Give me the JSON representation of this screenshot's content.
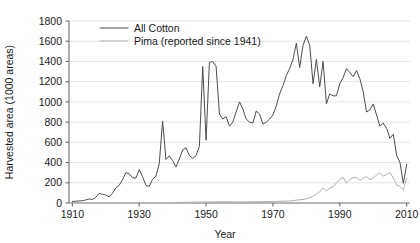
{
  "chart_data": {
    "type": "line",
    "title": "",
    "xlabel": "Year",
    "ylabel": "Harvested area (1000 areas)",
    "xlim": [
      1909,
      2011
    ],
    "ylim": [
      0,
      1800
    ],
    "xticks": [
      1910,
      1930,
      1950,
      1970,
      1990,
      2010
    ],
    "yticks": [
      0,
      200,
      400,
      600,
      800,
      1000,
      1200,
      1400,
      1600,
      1800
    ],
    "grid": "horizontal",
    "legend_position": "top-left-inside",
    "series": [
      {
        "name": "All Cotton",
        "color": "#4d4d4d",
        "x": [
          1910,
          1911,
          1912,
          1913,
          1914,
          1915,
          1916,
          1917,
          1918,
          1919,
          1920,
          1921,
          1922,
          1923,
          1924,
          1925,
          1926,
          1927,
          1928,
          1929,
          1930,
          1931,
          1932,
          1933,
          1934,
          1935,
          1936,
          1937,
          1938,
          1939,
          1940,
          1941,
          1942,
          1943,
          1944,
          1945,
          1946,
          1947,
          1948,
          1949,
          1950,
          1951,
          1952,
          1953,
          1954,
          1955,
          1956,
          1957,
          1958,
          1959,
          1960,
          1961,
          1962,
          1963,
          1964,
          1965,
          1966,
          1967,
          1968,
          1969,
          1970,
          1971,
          1972,
          1973,
          1974,
          1975,
          1976,
          1977,
          1978,
          1979,
          1980,
          1981,
          1982,
          1983,
          1984,
          1985,
          1986,
          1987,
          1988,
          1989,
          1990,
          1991,
          1992,
          1993,
          1994,
          1995,
          1996,
          1997,
          1998,
          1999,
          2000,
          2001,
          2002,
          2003,
          2004,
          2005,
          2006,
          2007,
          2008,
          2009,
          2010
        ],
        "y": [
          15,
          18,
          20,
          22,
          30,
          40,
          35,
          55,
          95,
          85,
          80,
          60,
          95,
          150,
          175,
          230,
          300,
          290,
          250,
          245,
          330,
          260,
          175,
          165,
          235,
          265,
          390,
          810,
          430,
          465,
          420,
          355,
          435,
          525,
          545,
          470,
          440,
          470,
          560,
          1350,
          620,
          1390,
          1400,
          1350,
          880,
          830,
          855,
          760,
          800,
          900,
          1000,
          930,
          830,
          800,
          790,
          910,
          880,
          780,
          800,
          830,
          870,
          960,
          1080,
          1160,
          1260,
          1330,
          1420,
          1580,
          1340,
          1560,
          1650,
          1560,
          1180,
          1420,
          1150,
          1400,
          980,
          1080,
          1060,
          1060,
          1180,
          1240,
          1330,
          1290,
          1250,
          1310,
          1230,
          1100,
          900,
          920,
          980,
          870,
          760,
          790,
          740,
          640,
          680,
          470,
          400,
          195,
          380
        ]
      },
      {
        "name": "Pima (reported since 1941)",
        "color": "#b0b0b0",
        "x": [
          1941,
          1945,
          1950,
          1955,
          1960,
          1965,
          1970,
          1975,
          1980,
          1982,
          1984,
          1985,
          1986,
          1987,
          1988,
          1989,
          1990,
          1991,
          1992,
          1993,
          1994,
          1995,
          1996,
          1997,
          1998,
          1999,
          2000,
          2001,
          2002,
          2003,
          2004,
          2005,
          2006,
          2007,
          2008,
          2009,
          2010
        ],
        "y": [
          5,
          8,
          10,
          12,
          10,
          12,
          15,
          20,
          40,
          65,
          110,
          150,
          120,
          145,
          160,
          200,
          230,
          255,
          195,
          230,
          250,
          255,
          225,
          245,
          260,
          230,
          250,
          275,
          300,
          265,
          285,
          300,
          250,
          175,
          165,
          130,
          245
        ]
      }
    ]
  },
  "legend": {
    "entries": [
      {
        "label": "All Cotton"
      },
      {
        "label": "Pima (reported since 1941)"
      }
    ]
  },
  "axes": {
    "x_title": "Year",
    "y_title": "Harvested area (1000 areas)",
    "x_tick_labels": [
      "1910",
      "1930",
      "1950",
      "1970",
      "1990",
      "2010"
    ],
    "y_tick_labels": [
      "0",
      "200",
      "400",
      "600",
      "800",
      "1000",
      "1200",
      "1400",
      "1600",
      "1800"
    ]
  }
}
